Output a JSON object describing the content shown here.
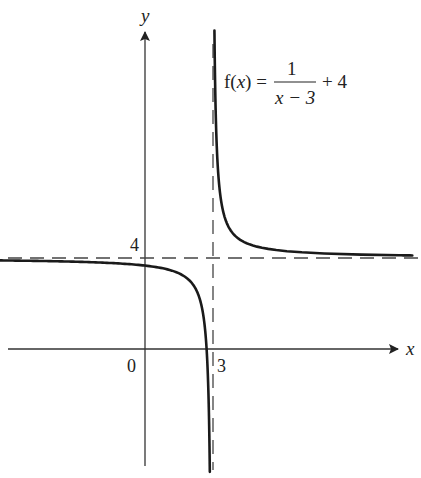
{
  "chart_data": {
    "type": "line",
    "title": "",
    "function_label": {
      "lhs": "f(x) =",
      "numerator": "1",
      "denominator": "x − 3",
      "suffix": "+ 4"
    },
    "xlabel": "x",
    "ylabel": "y",
    "tick_labels": {
      "origin": "0",
      "x_asymptote": "3",
      "y_asymptote": "4"
    },
    "asymptotes": {
      "vertical": {
        "x": 3,
        "style": "dashed"
      },
      "horizontal": {
        "y": 4,
        "style": "dashed"
      }
    },
    "xlim": [
      -6.3,
      11.5
    ],
    "ylim": [
      -5.5,
      13.5
    ],
    "grid": false,
    "legend": null,
    "series": [
      {
        "name": "f(x) = 1/(x-3) + 4, left branch",
        "x": [
          -6.3,
          -5,
          -4,
          -3,
          -2,
          -1,
          0,
          1,
          1.5,
          2,
          2.25,
          2.5,
          2.6,
          2.7,
          2.75,
          2.8,
          2.85,
          2.9,
          2.92
        ],
        "y": [
          3.89,
          3.88,
          3.86,
          3.83,
          3.8,
          3.75,
          3.67,
          3.5,
          3.33,
          3.0,
          2.67,
          2.0,
          1.5,
          0.67,
          0.0,
          -1.0,
          -2.67,
          -6.0,
          -8.5
        ]
      },
      {
        "name": "f(x) = 1/(x-3) + 4, right branch",
        "x": [
          3.1,
          3.15,
          3.2,
          3.3,
          3.5,
          4,
          5,
          6,
          7,
          8,
          9,
          10,
          11.5
        ],
        "y": [
          14.0,
          10.67,
          9.0,
          7.33,
          6.0,
          5.0,
          4.5,
          4.33,
          4.25,
          4.2,
          4.17,
          4.14,
          4.12
        ]
      }
    ],
    "colors": {
      "curve": "#1a1a1a",
      "axes": "#333333",
      "asymptote": "#333333"
    }
  }
}
